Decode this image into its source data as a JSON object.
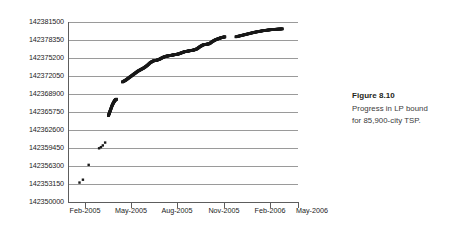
{
  "caption": {
    "title": "Figure 8.10",
    "line1": "Progress in LP bound",
    "line2": "for 85,900-city TSP."
  },
  "colors": {
    "marker": "#1a1a1a",
    "gridline": "#9a9a9a",
    "axis": "#5d5d5d",
    "text": "#1c1c1c",
    "caption_title": "#231f20",
    "caption_body": "#3a3a3a",
    "background": "#ffffff"
  },
  "chart_data": {
    "type": "scatter",
    "title": "",
    "xlabel": "",
    "ylabel": "",
    "grid": true,
    "legend": null,
    "ylim": [
      142350000,
      142381500
    ],
    "ytick_step": 3150,
    "ytick_labels": [
      "142350000",
      "142353150",
      "142356300",
      "142359450",
      "142362600",
      "142365750",
      "142368900",
      "142372050",
      "142375200",
      "142378350",
      "142381500"
    ],
    "ytick_values": [
      142350000,
      142353150,
      142356300,
      142359450,
      142362600,
      142365750,
      142368900,
      142372050,
      142375200,
      142378350,
      142381500
    ],
    "xtick_labels": [
      "Feb-2005",
      "May-2005",
      "Aug-2005",
      "Nov-2005",
      "Feb-2006",
      "May-2006"
    ],
    "xlim": [
      "Jan-2005",
      "Jun-2006"
    ],
    "series": [
      {
        "name": "early-isolated-points",
        "points": [
          {
            "x": 0.4,
            "y": 142353400
          },
          {
            "x": 2.6,
            "y": 142353900
          },
          {
            "x": 6.3,
            "y": 142356500
          },
          {
            "x": 13.0,
            "y": 142359400
          },
          {
            "x": 14.2,
            "y": 142359600
          },
          {
            "x": 15.4,
            "y": 142359900
          },
          {
            "x": 16.9,
            "y": 142360400
          }
        ]
      },
      {
        "name": "second-burst",
        "points": [
          {
            "x": 19.0,
            "y": 142365100
          },
          {
            "x": 19.8,
            "y": 142365700
          },
          {
            "x": 20.6,
            "y": 142366300
          },
          {
            "x": 21.4,
            "y": 142366900
          },
          {
            "x": 22.3,
            "y": 142367400
          },
          {
            "x": 23.2,
            "y": 142367800
          },
          {
            "x": 24.2,
            "y": 142368000
          }
        ]
      },
      {
        "name": "main-progress-curve",
        "points": [
          {
            "x": 28.0,
            "y": 142371000
          },
          {
            "x": 30.0,
            "y": 142371300
          },
          {
            "x": 32.0,
            "y": 142371700
          },
          {
            "x": 34.0,
            "y": 142372100
          },
          {
            "x": 36.0,
            "y": 142372500
          },
          {
            "x": 38.0,
            "y": 142372900
          },
          {
            "x": 40.0,
            "y": 142373200
          },
          {
            "x": 42.0,
            "y": 142373500
          },
          {
            "x": 44.0,
            "y": 142373900
          },
          {
            "x": 46.0,
            "y": 142374400
          },
          {
            "x": 48.0,
            "y": 142374700
          },
          {
            "x": 50.0,
            "y": 142374800
          },
          {
            "x": 52.0,
            "y": 142375000
          },
          {
            "x": 54.0,
            "y": 142375300
          },
          {
            "x": 56.0,
            "y": 142375500
          },
          {
            "x": 58.0,
            "y": 142375600
          },
          {
            "x": 60.0,
            "y": 142375700
          },
          {
            "x": 62.0,
            "y": 142375800
          },
          {
            "x": 64.0,
            "y": 142375900
          },
          {
            "x": 66.0,
            "y": 142376100
          },
          {
            "x": 68.0,
            "y": 142376300
          },
          {
            "x": 70.0,
            "y": 142376400
          },
          {
            "x": 72.0,
            "y": 142376500
          },
          {
            "x": 74.0,
            "y": 142376600
          },
          {
            "x": 76.0,
            "y": 142376800
          },
          {
            "x": 78.0,
            "y": 142377200
          },
          {
            "x": 80.0,
            "y": 142377500
          },
          {
            "x": 82.0,
            "y": 142377600
          },
          {
            "x": 84.0,
            "y": 142377700
          },
          {
            "x": 86.0,
            "y": 142378100
          },
          {
            "x": 88.0,
            "y": 142378400
          },
          {
            "x": 90.0,
            "y": 142378600
          },
          {
            "x": 92.0,
            "y": 142378800
          },
          {
            "x": 94.0,
            "y": 142378900
          }
        ]
      },
      {
        "name": "final-segment",
        "points": [
          {
            "x": 101.0,
            "y": 142378900
          },
          {
            "x": 104.0,
            "y": 142379100
          },
          {
            "x": 107.0,
            "y": 142379300
          },
          {
            "x": 110.0,
            "y": 142379500
          },
          {
            "x": 113.0,
            "y": 142379700
          },
          {
            "x": 116.0,
            "y": 142379850
          },
          {
            "x": 119.0,
            "y": 142380000
          },
          {
            "x": 122.0,
            "y": 142380100
          },
          {
            "x": 125.0,
            "y": 142380200
          },
          {
            "x": 128.0,
            "y": 142380250
          },
          {
            "x": 131.0,
            "y": 142380300
          }
        ]
      }
    ]
  }
}
